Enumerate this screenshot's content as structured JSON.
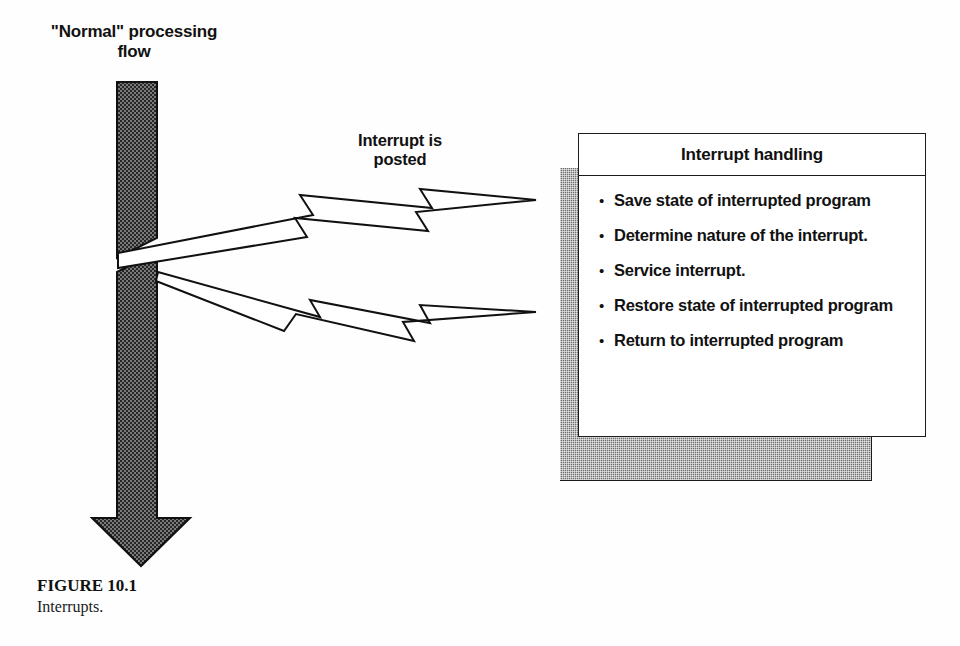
{
  "figure": {
    "domain": "Diagram",
    "background_color": "#fefefe",
    "ink_color": "#111111",
    "hatch_fill_color": "#6f6f6f"
  },
  "flow": {
    "label": "\"Normal\" processing\nflow",
    "arrow_name": "normal-processing-flow-arrow",
    "direction": "down"
  },
  "interrupt_signal": {
    "label": "Interrupt is\nposted",
    "bolt_top_name": "return-lightning-bolt",
    "bolt_bottom_name": "interrupt-lightning-bolt"
  },
  "panel": {
    "title": "Interrupt handling",
    "bullet_marker": "•",
    "items": [
      "Save state of interrupted program",
      "Determine nature of the interrupt.",
      "Service interrupt.",
      "Restore state of interrupted program",
      "Return to interrupted program"
    ]
  },
  "caption": {
    "title": "FIGURE 10.1",
    "text": "Interrupts."
  }
}
